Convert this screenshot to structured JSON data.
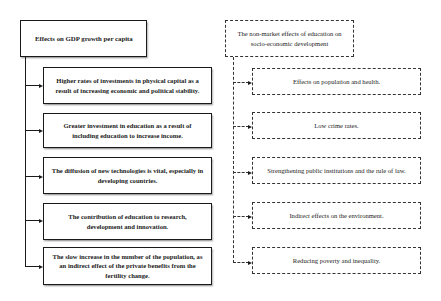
{
  "left_branch": {
    "title": "Effects on GDP growth per capita",
    "line_style": "solid",
    "items": [
      {
        "label": "Higher rates of investments in physical capital as a result of increasing economic and political stability."
      },
      {
        "label": "Greater investment in education as a result of including education to increase income."
      },
      {
        "label": "The diffusion of new technologies is vital, especially in developing countries."
      },
      {
        "label": "The contribution of education to research, development and innovation."
      },
      {
        "label": "The slow increase in the number of the population, as an indirect effect of the private benefits from the fertility change."
      }
    ]
  },
  "right_branch": {
    "title": "The non-market effects of education on socio-economic development",
    "line_style": "dashed",
    "items": [
      {
        "label": "Effects on population and health."
      },
      {
        "label": "Low crime rates."
      },
      {
        "label": "Strengthening public institutions and the rule of law."
      },
      {
        "label": "Indirect effects on the environment."
      },
      {
        "label": "Reducing poverty and inequality."
      }
    ]
  },
  "colors": {
    "line": "#1a1a1a",
    "background": "#ffffff"
  }
}
